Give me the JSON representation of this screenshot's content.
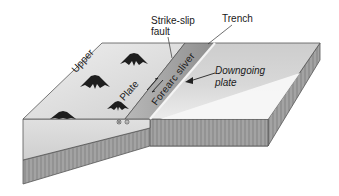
{
  "diagram": {
    "type": "block-diagram",
    "labels": {
      "strike_slip_fault": "Strike-slip fault",
      "trench": "Trench",
      "upper": "Upper",
      "plate": "Plate",
      "forearc_sliver": "Forearc sliver",
      "downgoing_plate": "Downgoing plate"
    },
    "symbols": {
      "volcanoes": 4,
      "strike_slip_arrows": "opposing half-arrows along fault",
      "subduction_direction_arrow": "arrow pointing toward trench from downgoing plate label",
      "out_of_page_symbol": "dot (toward viewer)",
      "into_page_symbol": "cross (away from viewer)"
    },
    "colors": {
      "upper_plate_surface": "#d9d9d9",
      "forearc_sliver": "#a6a6a6",
      "downgoing_surface_light": "#f2f2f2",
      "downgoing_surface_dark": "#bfbfbf",
      "front_face": "#d4d4d4",
      "slab_hatch": "#9a9a9a",
      "outline": "#555555",
      "volcano": "#1e1e1e"
    }
  }
}
